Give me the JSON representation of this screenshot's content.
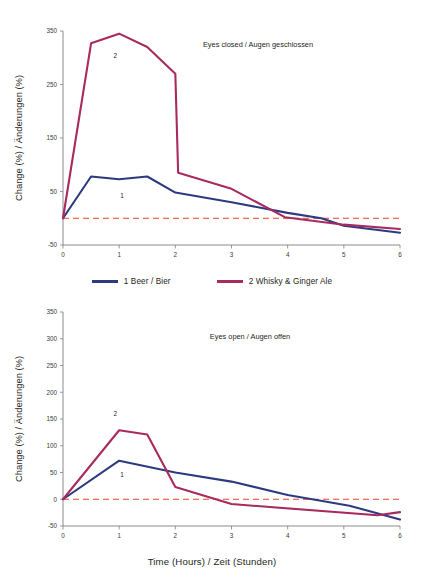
{
  "figure": {
    "background_color": "#ffffff",
    "x_axis_title": "Time (Hours) / Zeit (Stunden)",
    "y_axis_title": "Change (%) / Änderungen (%)"
  },
  "legend": {
    "position": "between-panels",
    "entries": [
      {
        "label": "1 Beer / Bier",
        "color": "#2e3a80",
        "marker": "1"
      },
      {
        "label": "2 Whisky & Ginger Ale",
        "color": "#a82a5e",
        "marker": "2"
      }
    ]
  },
  "colors": {
    "series_beer": "#2e3a80",
    "series_whisky": "#a82a5e",
    "zero_line": "#e8452c",
    "axis": "#808080",
    "text": "#231f20"
  },
  "chart_data": [
    {
      "type": "line",
      "title": "Eyes closed / Augen geschlossen",
      "xlabel": "Time (Hours) / Zeit (Stunden)",
      "ylabel": "Change (%) / Änderungen (%)",
      "xlim": [
        0,
        6
      ],
      "ylim": [
        -50,
        350
      ],
      "xticks": [
        0,
        1,
        2,
        3,
        4,
        5,
        6
      ],
      "xtick_labels": [
        "0",
        "1",
        "2",
        "3",
        "4",
        "5",
        "6"
      ],
      "yticks": [
        -50,
        50,
        150,
        250,
        350
      ],
      "ytick_labels": [
        "-50",
        "50",
        "150",
        "250",
        "350"
      ],
      "grid": false,
      "zero_reference_line": 0,
      "series": [
        {
          "name": "1 Beer / Bier",
          "marker_label": "1",
          "marker_at": {
            "x": 1.05,
            "y": 38
          },
          "color": "#2e3a80",
          "x": [
            0,
            0.5,
            1,
            1.5,
            2,
            3,
            4,
            4.6,
            5,
            6
          ],
          "values": [
            0,
            78,
            73,
            78,
            48,
            30,
            10,
            0,
            -14,
            -27
          ]
        },
        {
          "name": "2 Whisky & Ginger Ale",
          "marker_label": "2",
          "marker_at": {
            "x": 0.93,
            "y": 300
          },
          "color": "#a82a5e",
          "x": [
            0,
            0.5,
            1,
            1.5,
            2,
            2.05,
            3,
            3.95,
            5,
            6
          ],
          "values": [
            0,
            327,
            345,
            320,
            270,
            85,
            55,
            2,
            -12,
            -20
          ]
        }
      ]
    },
    {
      "type": "line",
      "title": "Eyes open / Augen offen",
      "xlabel": "Time (Hours) / Zeit (Stunden)",
      "ylabel": "Change (%) / Änderungen (%)",
      "xlim": [
        0,
        6
      ],
      "ylim": [
        -50,
        350
      ],
      "xticks": [
        0,
        1,
        2,
        3,
        4,
        5,
        6
      ],
      "xtick_labels": [
        "0",
        "1",
        "2",
        "3",
        "4",
        "5",
        "6"
      ],
      "yticks": [
        -50,
        0,
        50,
        100,
        150,
        200,
        250,
        300,
        350
      ],
      "ytick_labels": [
        "-50",
        "0",
        "50",
        "100",
        "150",
        "200",
        "250",
        "300",
        "350"
      ],
      "grid": false,
      "zero_reference_line": 0,
      "series": [
        {
          "name": "1 Beer / Bier",
          "marker_label": "1",
          "marker_at": {
            "x": 1.05,
            "y": 42
          },
          "color": "#2e3a80",
          "x": [
            0,
            1,
            2,
            3,
            4,
            5.1,
            6
          ],
          "values": [
            0,
            72,
            50,
            33,
            8,
            -12,
            -38
          ]
        },
        {
          "name": "2 Whisky & Ginger Ale",
          "marker_label": "2",
          "marker_at": {
            "x": 0.93,
            "y": 155
          },
          "color": "#a82a5e",
          "x": [
            0,
            1,
            1.5,
            2,
            3,
            5.6,
            6
          ],
          "values": [
            0,
            129,
            121,
            23,
            -9,
            -30,
            -24
          ]
        }
      ]
    }
  ]
}
